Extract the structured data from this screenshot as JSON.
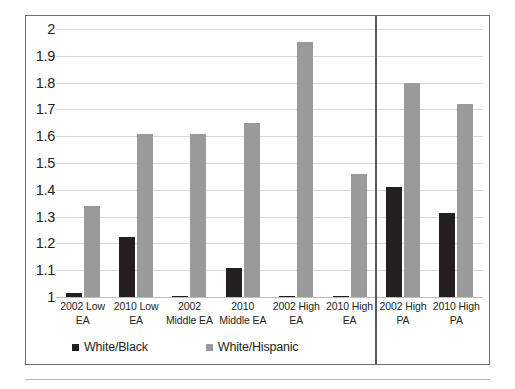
{
  "chart_data": {
    "type": "bar",
    "title": "",
    "subtitle": "",
    "xlabel": "",
    "ylabel": "",
    "ylim": [
      1,
      2
    ],
    "ytick_step": 0.1,
    "grid": true,
    "legend_position": "bottom-left",
    "yticks": [
      "2",
      "1.9",
      "1.8",
      "1.7",
      "1.6",
      "1.5",
      "1.4",
      "1.3",
      "1.2",
      "1.1",
      "1"
    ],
    "categories": [
      "2002 Low EA",
      "2010 Low EA",
      "2002 Middle EA",
      "2010 Middle EA",
      "2002 High EA",
      "2010 High EA",
      "2002 High PA",
      "2010 High PA"
    ],
    "category_lines": [
      [
        "2002 Low",
        "EA"
      ],
      [
        "2010 Low",
        "EA"
      ],
      [
        "2002",
        "Middle EA"
      ],
      [
        "2010",
        "Middle EA"
      ],
      [
        "2002 High",
        "EA"
      ],
      [
        "2010 High",
        "EA"
      ],
      [
        "2002 High",
        "PA"
      ],
      [
        "2010 High",
        "PA"
      ]
    ],
    "series": [
      {
        "name": "White/Black",
        "color": "#231f20",
        "values": [
          1.015,
          1.225,
          1.0,
          1.11,
          1.0,
          1.0,
          1.41,
          1.315
        ]
      },
      {
        "name": "White/Hispanic",
        "color": "#9a9a9a",
        "values": [
          1.34,
          1.61,
          1.61,
          1.65,
          1.95,
          1.46,
          1.8,
          1.72
        ]
      }
    ],
    "panel_divider_after_category_index": 5,
    "annotations": []
  },
  "legend": {
    "items": [
      {
        "label": "White/Black",
        "swatch": "#231f20"
      },
      {
        "label": "White/Hispanic",
        "swatch": "#9a9a9a"
      }
    ]
  }
}
